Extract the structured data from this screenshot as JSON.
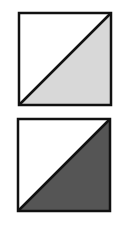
{
  "figures": [
    {
      "name": "square-light-diagonal",
      "x": 19,
      "y": 13,
      "size": 92,
      "shaded_half": "lower-right",
      "fill": "#d8d8d8",
      "stroke": "#111111"
    },
    {
      "name": "square-dark-diagonal",
      "x": 18,
      "y": 119,
      "size": 92,
      "shaded_half": "lower-right",
      "fill": "#555555",
      "stroke": "#111111"
    }
  ]
}
